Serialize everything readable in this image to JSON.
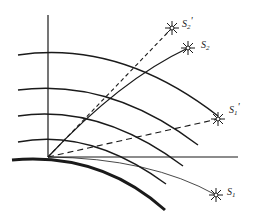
{
  "diagram": {
    "type": "atmospheric-refraction",
    "stars": [
      {
        "id": "S2_apparent",
        "label": "S",
        "sub": "2",
        "prime": "'",
        "x": 172,
        "y": 28
      },
      {
        "id": "S2",
        "label": "S",
        "sub": "2",
        "prime": "",
        "x": 188,
        "y": 48
      },
      {
        "id": "S1_apparent",
        "label": "S",
        "sub": "1",
        "prime": "'",
        "x": 218,
        "y": 119
      },
      {
        "id": "S1",
        "label": "S",
        "sub": "1",
        "prime": "",
        "x": 216,
        "y": 195
      }
    ],
    "observer": {
      "x": 48,
      "y": 157
    },
    "colors": {
      "stroke": "#1a1a1a",
      "background": "#ffffff"
    }
  }
}
